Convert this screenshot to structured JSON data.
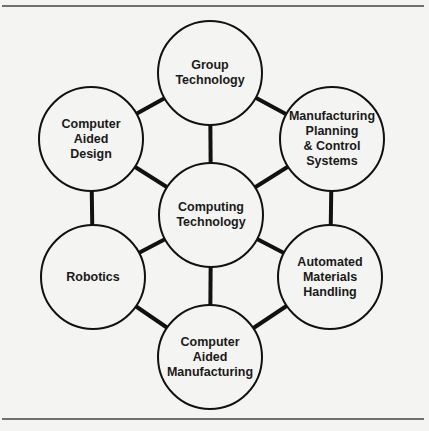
{
  "diagram": {
    "title": "",
    "center": {
      "id": "computing",
      "label": "Computing\nTechnology",
      "cx": 211,
      "cy": 215
    },
    "nodes": [
      {
        "id": "group",
        "label": "Group\nTechnology",
        "cx": 210,
        "cy": 73
      },
      {
        "id": "mpcs",
        "label": "Manufacturing\nPlanning\n& Control\nSystems",
        "cx": 332,
        "cy": 139
      },
      {
        "id": "amh",
        "label": "Automated\nMaterials\nHandling",
        "cx": 330,
        "cy": 277
      },
      {
        "id": "cam",
        "label": "Computer\nAided\nManufacturing",
        "cx": 210,
        "cy": 357
      },
      {
        "id": "robotics",
        "label": "Robotics",
        "cx": 93,
        "cy": 277
      },
      {
        "id": "cad",
        "label": "Computer\nAided\nDesign",
        "cx": 91,
        "cy": 139
      }
    ],
    "radius": 52,
    "edges": [
      [
        "group",
        "mpcs"
      ],
      [
        "mpcs",
        "amh"
      ],
      [
        "amh",
        "cam"
      ],
      [
        "cam",
        "robotics"
      ],
      [
        "robotics",
        "cad"
      ],
      [
        "cad",
        "group"
      ],
      [
        "computing",
        "group"
      ],
      [
        "computing",
        "mpcs"
      ],
      [
        "computing",
        "amh"
      ],
      [
        "computing",
        "cam"
      ],
      [
        "computing",
        "robotics"
      ],
      [
        "computing",
        "cad"
      ]
    ],
    "colors": {
      "line": "#111111",
      "fill": "#f4f4f2",
      "rule": "#444444"
    }
  }
}
